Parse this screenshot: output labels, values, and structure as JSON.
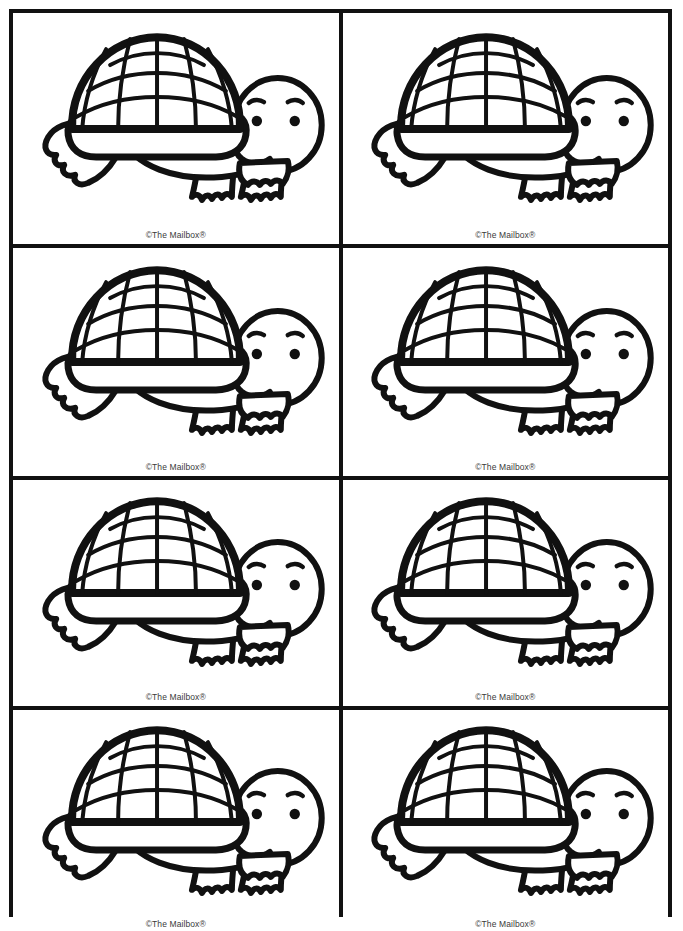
{
  "page": {
    "background_color": "#ffffff",
    "ink_color": "#111111",
    "width": 683,
    "height": 920,
    "grid": {
      "columns": 2,
      "rows": 4,
      "card_count": 8
    }
  },
  "artwork": {
    "subject": "turtle",
    "style": "black-and-white line art coloring outline",
    "description": "Cartoon turtle facing right with a large domed patterned shell, oval head with two eyes and eyebrows, two front legs with clawed feet and a pointed tail at the left",
    "stroke_color": "#111111",
    "fill_color": "#ffffff"
  },
  "credit": {
    "text": "©The Mailbox®",
    "copyright_symbol": "©",
    "brand": "The Mailbox",
    "registered_symbol": "®"
  },
  "cards": [
    {
      "id": "card-1",
      "row": 1,
      "column": 1,
      "credit": "©The Mailbox®",
      "artwork": "turtle"
    },
    {
      "id": "card-2",
      "row": 1,
      "column": 2,
      "credit": "©The Mailbox®",
      "artwork": "turtle"
    },
    {
      "id": "card-3",
      "row": 2,
      "column": 1,
      "credit": "©The Mailbox®",
      "artwork": "turtle"
    },
    {
      "id": "card-4",
      "row": 2,
      "column": 2,
      "credit": "©The Mailbox®",
      "artwork": "turtle"
    },
    {
      "id": "card-5",
      "row": 3,
      "column": 1,
      "credit": "©The Mailbox®",
      "artwork": "turtle"
    },
    {
      "id": "card-6",
      "row": 3,
      "column": 2,
      "credit": "©The Mailbox®",
      "artwork": "turtle"
    },
    {
      "id": "card-7",
      "row": 4,
      "column": 1,
      "credit": "©The Mailbox®",
      "artwork": "turtle"
    },
    {
      "id": "card-8",
      "row": 4,
      "column": 2,
      "credit": "©The Mailbox®",
      "artwork": "turtle"
    }
  ]
}
